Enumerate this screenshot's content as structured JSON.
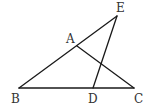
{
  "diagram": {
    "type": "geometry",
    "points": {
      "A": {
        "label": "A",
        "x": 77,
        "y": 46,
        "lx": 66,
        "ly": 43
      },
      "B": {
        "label": "B",
        "x": 19,
        "y": 88,
        "lx": 11,
        "ly": 103
      },
      "C": {
        "label": "C",
        "x": 134,
        "y": 88,
        "lx": 134,
        "ly": 103
      },
      "D": {
        "label": "D",
        "x": 93,
        "y": 88,
        "lx": 88,
        "ly": 103
      },
      "E": {
        "label": "E",
        "x": 117,
        "y": 16,
        "lx": 116,
        "ly": 12
      }
    },
    "segments": [
      {
        "from": "B",
        "to": "E"
      },
      {
        "from": "B",
        "to": "C"
      },
      {
        "from": "A",
        "to": "C"
      },
      {
        "from": "E",
        "to": "D"
      }
    ]
  }
}
